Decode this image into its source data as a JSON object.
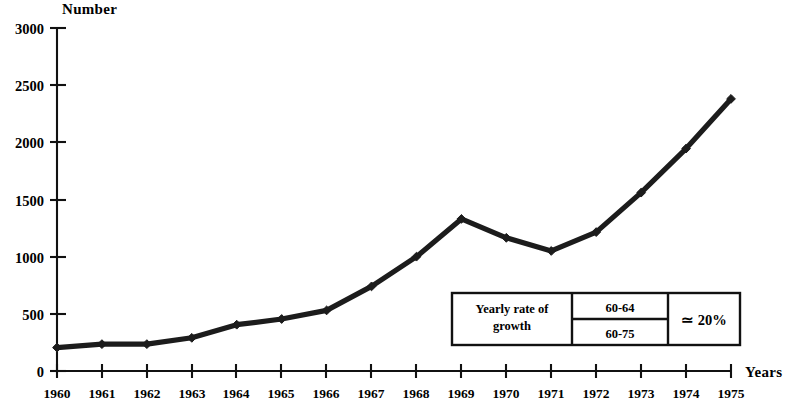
{
  "chart_data": {
    "type": "line",
    "title": "",
    "ylabel": "Number",
    "xlabel": "Years",
    "x": [
      1960,
      1961,
      1962,
      1963,
      1964,
      1965,
      1966,
      1967,
      1968,
      1969,
      1970,
      1971,
      1972,
      1973,
      1974,
      1975
    ],
    "categories": [
      "1960",
      "1961",
      "1962",
      "1963",
      "1964",
      "1965",
      "1966",
      "1967",
      "1968",
      "1969",
      "1970",
      "1971",
      "1972",
      "1973",
      "1974",
      "1975"
    ],
    "values": [
      205,
      235,
      235,
      290,
      405,
      455,
      530,
      740,
      1000,
      1330,
      1165,
      1050,
      1215,
      1560,
      1945,
      2380
    ],
    "ylim": [
      0,
      3000
    ],
    "xlim": [
      1960,
      1975
    ],
    "yticks": [
      0,
      500,
      1000,
      1500,
      2000,
      2500,
      3000
    ],
    "ytick_labels": [
      "0",
      "500",
      "1000",
      "1500",
      "2000",
      "2500",
      "3000"
    ],
    "grid": false,
    "legend": "none",
    "markers": "diamond",
    "series_color": "#1c1c1c"
  },
  "annotation_table": {
    "label": "Yearly rate of\ngrowth",
    "label_line1": "Yearly rate of",
    "label_line2": "growth",
    "periods": [
      "60-64",
      "60-75"
    ],
    "value": "≃ 20%"
  }
}
